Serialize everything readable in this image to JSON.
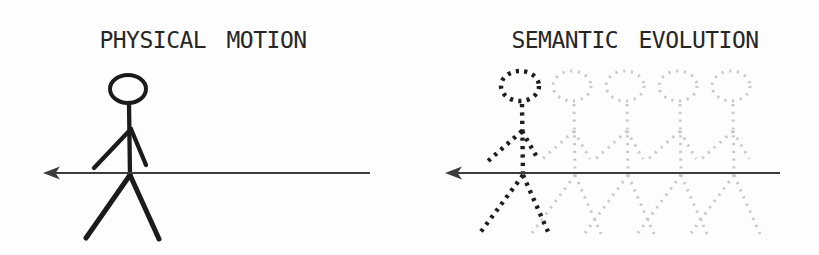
{
  "panels": {
    "left": {
      "title": "PHYSICAL MOTION",
      "figure": "solid stick figure walking",
      "arrow_direction": "left"
    },
    "right": {
      "title": "SEMANTIC EVOLUTION",
      "figure": "dotted stick figure walking",
      "ghost_figure_count": 4,
      "arrow_direction": "left"
    }
  },
  "colors": {
    "background": "#fdfdfd",
    "title": "#262626",
    "figure": "#1b1b1b",
    "dotted_figure": "#1e1e1e",
    "ghost_figure": "#c9c9c9",
    "arrow": "#3c3c3c"
  }
}
